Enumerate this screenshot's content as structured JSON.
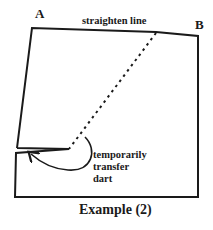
{
  "labels": {
    "corner_a": "A",
    "corner_b": "B",
    "top_edge": "straighten line",
    "dart_note": [
      "temporarily",
      "transfer",
      "dart"
    ],
    "caption": "Example (2)"
  },
  "colors": {
    "outline": "#1a1a1a",
    "background": "#ffffff"
  }
}
